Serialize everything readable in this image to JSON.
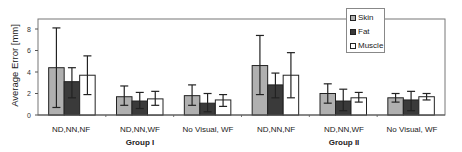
{
  "chart_data": {
    "type": "bar",
    "title": "",
    "xlabel": "",
    "ylabel": "Average Error [mm]",
    "ylim": [
      0,
      8.5
    ],
    "yticks": [
      0,
      2,
      4,
      6,
      8
    ],
    "grid": false,
    "legend_position": "top-right",
    "categories": [
      "ND,NN,NF",
      "ND,NN,WF",
      "No Visual, WF",
      "ND,NN,NF",
      "ND,NN,WF",
      "No Visual, WF"
    ],
    "groups": [
      {
        "label": "Group I",
        "categories": [
          "ND,NN,NF",
          "ND,NN,WF",
          "No Visual, WF"
        ]
      },
      {
        "label": "Group II",
        "categories": [
          "ND,NN,NF",
          "ND,NN,WF",
          "No Visual, WF"
        ]
      }
    ],
    "series": [
      {
        "name": "Skin",
        "color": "#b0b0b0",
        "values": [
          4.4,
          1.7,
          1.8,
          4.6,
          2.0,
          1.6
        ],
        "error_high": [
          8.1,
          2.7,
          2.8,
          7.4,
          2.9,
          2.0
        ],
        "error_low": [
          0.7,
          0.9,
          0.9,
          1.9,
          1.1,
          1.2
        ]
      },
      {
        "name": "Fat",
        "color": "#3a3a3a",
        "values": [
          3.1,
          1.3,
          1.1,
          2.8,
          1.3,
          1.4
        ],
        "error_high": [
          4.4,
          2.1,
          2.0,
          3.9,
          2.4,
          2.2
        ],
        "error_low": [
          1.6,
          0.6,
          0.3,
          1.6,
          0.4,
          0.4
        ]
      },
      {
        "name": "Muscle",
        "color": "#ffffff",
        "values": [
          3.7,
          1.5,
          1.4,
          3.7,
          1.6,
          1.7
        ],
        "error_high": [
          5.5,
          2.2,
          1.9,
          5.8,
          2.1,
          2.0
        ],
        "error_low": [
          1.9,
          0.9,
          0.8,
          1.6,
          1.2,
          1.4
        ]
      }
    ]
  }
}
